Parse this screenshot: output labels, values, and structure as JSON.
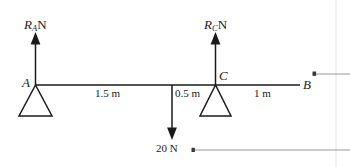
{
  "figure": {
    "type": "beam-free-body-diagram",
    "background_color": "#ffffff",
    "line_color": "#1a1a1a",
    "annotation_line_color": "#9a9a9a",
    "beam": {
      "left_point_label": "A",
      "right_point_label": "B",
      "support_point_label": "C"
    },
    "forces": [
      {
        "name": "reaction-at-A",
        "symbol": "R",
        "subscript": "A",
        "unit": "N",
        "direction": "up"
      },
      {
        "name": "reaction-at-C",
        "symbol": "R",
        "subscript": "C",
        "unit": "N",
        "direction": "up"
      },
      {
        "name": "point-load",
        "label": "20 N",
        "value": 20,
        "unit": "N",
        "direction": "down"
      }
    ],
    "dimensions": [
      {
        "name": "A-to-load",
        "label": "1.5 m",
        "value": 1.5,
        "unit": "m"
      },
      {
        "name": "load-to-C",
        "label": "0.5 m",
        "value": 0.5,
        "unit": "m"
      },
      {
        "name": "C-to-B",
        "label": "1 m",
        "value": 1,
        "unit": "m"
      }
    ]
  }
}
